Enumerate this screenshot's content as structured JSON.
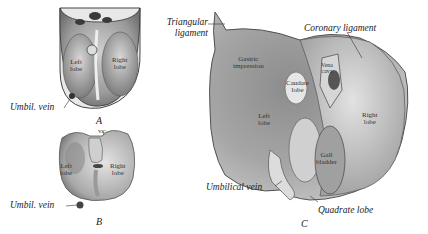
{
  "figure": {
    "panel_a": {
      "letter": "A",
      "labels": {
        "left_lobe_1": "Left",
        "left_lobe_2": "lobe",
        "right_lobe_1": "Right",
        "right_lobe_2": "lobe",
        "umbil_vein": "Umbil. vein"
      }
    },
    "panel_b": {
      "letter": "B",
      "labels": {
        "vc": "v.c.",
        "left_lobe_1": "Left",
        "left_lobe_2": "lobe",
        "right_lobe_1": "Right",
        "right_lobe_2": "lobe",
        "umbil_vein": "Umbil. vein"
      }
    },
    "panel_c": {
      "letter": "C",
      "labels": {
        "triangular_1": "Triangular",
        "triangular_2": "ligament",
        "coronary": "Coronary ligament",
        "gastric_1": "Gastric",
        "gastric_2": "impression",
        "caudate_1": "Caudate",
        "caudate_2": "lobe",
        "vena_1": "Vena",
        "vena_2": "cava",
        "left_lobe_1": "Left",
        "left_lobe_2": "lobe",
        "right_lobe_1": "Right",
        "right_lobe_2": "lobe",
        "gall_1": "Gall",
        "gall_2": "bladder",
        "umbilical_vein": "Umbilical vein",
        "quadrate": "Quadrate lobe"
      }
    }
  }
}
